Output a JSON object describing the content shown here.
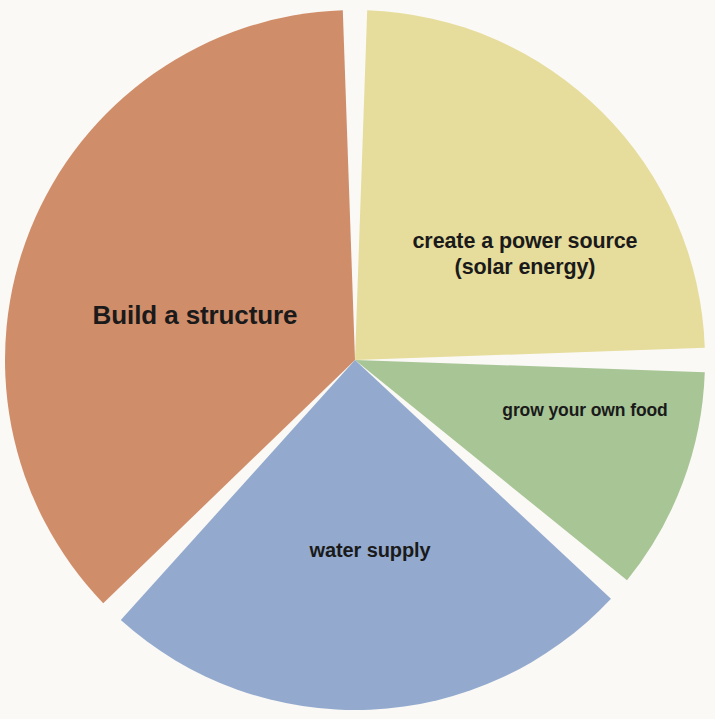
{
  "chart_data": {
    "type": "pie",
    "title": "",
    "subtitle": "",
    "xlabel": "",
    "ylabel": "",
    "legend_position": "none",
    "grid": false,
    "labels_inside_slices": true,
    "background_color": "#faf9f5",
    "label_text_color": "#1a1a1a",
    "slice_gap_degrees": 4,
    "categories": [
      "Build a structure",
      "create a power source (solar energy)",
      "grow your own food",
      "water supply"
    ],
    "values": [
      38,
      25,
      11,
      26
    ],
    "units": "percent",
    "colors": [
      "#d08d6a",
      "#e6dc9b",
      "#a8c596",
      "#93aace"
    ],
    "slices": [
      {
        "label": "Build a structure",
        "label_lines": "Build a structure",
        "value": 38,
        "color": "#d08d6a",
        "start_angle": 224,
        "end_angle": 360,
        "font_size": 26,
        "font_weight": "bold"
      },
      {
        "label": "create a power source (solar energy)",
        "label_lines": "create a power source\n(solar energy)",
        "value": 25,
        "color": "#e6dc9b",
        "start_angle": 0,
        "end_angle": 90,
        "font_size": 21,
        "font_weight": "bold"
      },
      {
        "label": "grow your own food",
        "label_lines": "grow your own food",
        "value": 11,
        "color": "#a8c596",
        "start_angle": 90,
        "end_angle": 131,
        "font_size": 17,
        "font_weight": "bold"
      },
      {
        "label": "water supply",
        "label_lines": "water supply",
        "value": 26,
        "color": "#93aace",
        "start_angle": 131,
        "end_angle": 224,
        "font_size": 20,
        "font_weight": "bold"
      }
    ]
  },
  "geometry": {
    "center_x": 355,
    "center_y": 360,
    "radius": 350
  }
}
